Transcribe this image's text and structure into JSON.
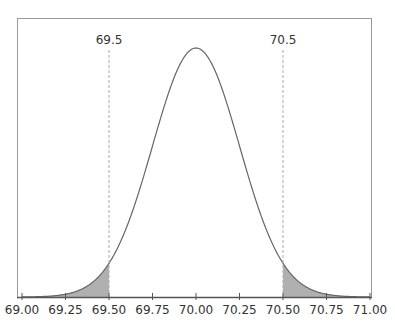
{
  "chart_data": {
    "type": "area",
    "title": "",
    "xlabel": "",
    "ylabel": "",
    "distribution": "normal",
    "mean": 70.0,
    "sd": 0.25,
    "xlim": [
      69.0,
      71.0
    ],
    "x_ticks": [
      69.0,
      69.25,
      69.5,
      69.75,
      70.0,
      70.25,
      70.5,
      70.75,
      71.0
    ],
    "x_tick_labels": [
      "69.00",
      "69.25",
      "69.50",
      "69.75",
      "70.00",
      "70.25",
      "70.50",
      "70.75",
      "71.00"
    ],
    "reference_lines": [
      {
        "x": 69.5,
        "label": "69.5",
        "style": "dashed"
      },
      {
        "x": 70.5,
        "label": "70.5",
        "style": "dashed"
      }
    ],
    "shaded_regions": [
      {
        "from": 69.0,
        "to": 69.5
      },
      {
        "from": 70.5,
        "to": 71.0
      }
    ],
    "grid": false,
    "legend": null
  },
  "colors": {
    "curve": "#666666",
    "shade": "#b0b0b0",
    "frame": "#999999",
    "axis": "#555555",
    "ref_line": "#aaaaaa",
    "text": "#333333"
  }
}
